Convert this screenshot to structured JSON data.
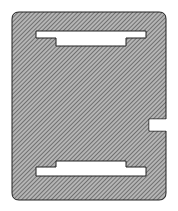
{
  "diagram": {
    "type": "hatched-cross-section",
    "colors": {
      "background": "#ffffff",
      "hatch_fill": "#9a9a9a",
      "hatch_line": "#444444",
      "outline": "#222222",
      "slot_fill": "#ffffff"
    },
    "plate": {
      "x": 12,
      "y": 12,
      "width": 154,
      "height": 188,
      "corner_radius": 7
    },
    "notch": {
      "x": 149,
      "y": 119,
      "width": 17,
      "height": 12
    },
    "top_slot": {
      "wide": {
        "x": 36,
        "y": 31,
        "width": 110,
        "height": 7
      },
      "narrow": {
        "x": 56,
        "y": 38,
        "width": 70,
        "height": 8
      }
    },
    "bottom_slot": {
      "narrow": {
        "x": 56,
        "y": 161,
        "width": 70,
        "height": 6
      },
      "wide": {
        "x": 36,
        "y": 167,
        "width": 110,
        "height": 9
      }
    }
  }
}
